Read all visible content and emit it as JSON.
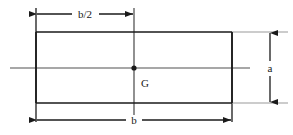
{
  "figure": {
    "type": "engineering-dimension-diagram",
    "background_color": "#ffffff",
    "line_color": "#1a1a1a",
    "centerline_color": "#808080"
  },
  "shape": {
    "name": "rectangle",
    "left": 36,
    "top": 32,
    "right": 232,
    "bottom": 103,
    "stroke_width": 1.6
  },
  "centroid": {
    "label": "G",
    "x": 134,
    "y": 68,
    "label_x": 145,
    "label_y": 84,
    "dot_radius": 2.6
  },
  "dimensions": [
    {
      "id": "half-width",
      "label": "b/2",
      "orientation": "horizontal",
      "from_x": 36,
      "to_x": 134,
      "y": 14,
      "label_x": 85,
      "label_y": 17,
      "arrows": "both"
    },
    {
      "id": "full-width",
      "label": "b",
      "orientation": "horizontal",
      "from_x": 36,
      "to_x": 232,
      "y": 120,
      "label_x": 134,
      "label_y": 124,
      "arrows": "both"
    },
    {
      "id": "height",
      "label": "a",
      "orientation": "vertical",
      "x": 270,
      "from_y": 32,
      "to_y": 103,
      "label_x": 277,
      "label_y": 71,
      "arrows": "both"
    }
  ],
  "centerlines": [
    {
      "id": "horizontal-axis",
      "orientation": "horizontal",
      "from_x": 10,
      "to_x": 250,
      "y": 68
    },
    {
      "id": "vertical-axis",
      "orientation": "vertical",
      "x": 134,
      "from_y": 8,
      "to_y": 115
    }
  ],
  "extension_lines": [
    {
      "id": "left-extension",
      "x": 36,
      "from_y": 8,
      "to_y": 122
    },
    {
      "id": "right-extension",
      "x": 232,
      "from_y": 32,
      "to_y": 122
    },
    {
      "id": "top-right-extension",
      "y": 32,
      "from_x": 232,
      "to_x": 285
    },
    {
      "id": "bottom-right-extension",
      "y": 103,
      "from_x": 232,
      "to_x": 285
    }
  ]
}
